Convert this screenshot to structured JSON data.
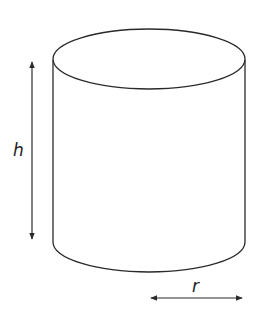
{
  "diagram": {
    "shape": "cylinder",
    "labels": {
      "height": "h",
      "radius": "r"
    },
    "colors": {
      "stroke": "#2a2a2a",
      "background": "#ffffff"
    }
  }
}
